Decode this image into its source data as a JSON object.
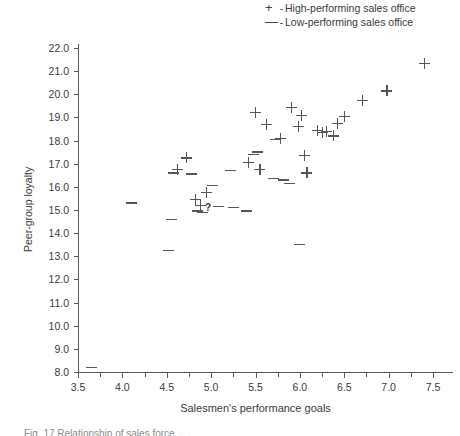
{
  "figure": {
    "caption_partial": "Fig. 17  Relationship of sales force ..."
  },
  "legend": {
    "position": "top-right",
    "items": [
      {
        "marker": "+",
        "marker_name": "plus-marker",
        "separator": "-",
        "label": "High-performing sales office"
      },
      {
        "marker": "—",
        "marker_name": "dash-marker",
        "separator": "-",
        "label": "Low-performing sales office"
      }
    ]
  },
  "chart_data": {
    "type": "scatter",
    "title": "",
    "xlabel": "Salesmen's performance goals",
    "ylabel": "Peer-group loyalty",
    "xlim": [
      3.5,
      7.5
    ],
    "ylim": [
      8.0,
      22.0
    ],
    "grid": false,
    "x_ticks": [
      "3.5",
      "4.0",
      "4.5",
      "5.0",
      "5.5",
      "6.0",
      "6.5",
      "7.0",
      "7.5"
    ],
    "x_tick_values": [
      3.5,
      4.0,
      4.5,
      5.0,
      5.5,
      6.0,
      6.5,
      7.0,
      7.5
    ],
    "x_minor_tick_values": [
      3.75,
      4.25,
      4.75,
      5.25,
      5.75,
      6.25,
      6.75,
      7.25
    ],
    "y_ticks": [
      "8.0",
      "9.0",
      "10.0",
      "11.0",
      "12.0",
      "13.0",
      "14.0",
      "15.0",
      "16.0",
      "17.0",
      "18.0",
      "19.0",
      "20.0",
      "21.0",
      "22.0"
    ],
    "y_tick_values": [
      8.0,
      9.0,
      10.0,
      11.0,
      12.0,
      13.0,
      14.0,
      15.0,
      16.0,
      17.0,
      18.0,
      19.0,
      20.0,
      21.0,
      22.0
    ],
    "series": [
      {
        "name": "High-performing sales office",
        "marker": "+",
        "points": [
          [
            4.62,
            16.75
          ],
          [
            4.72,
            17.25
          ],
          [
            4.82,
            15.45
          ],
          [
            4.88,
            15.2
          ],
          [
            4.95,
            15.75
          ],
          [
            5.42,
            17.05
          ],
          [
            5.5,
            19.2
          ],
          [
            5.55,
            16.75
          ],
          [
            5.62,
            18.7
          ],
          [
            5.78,
            18.1
          ],
          [
            5.9,
            19.45
          ],
          [
            5.98,
            18.6
          ],
          [
            6.02,
            19.1
          ],
          [
            6.05,
            17.35
          ],
          [
            6.08,
            16.6
          ],
          [
            6.2,
            18.45
          ],
          [
            6.25,
            18.35
          ],
          [
            6.3,
            18.4
          ],
          [
            6.38,
            18.2
          ],
          [
            6.42,
            18.75
          ],
          [
            6.5,
            19.05
          ],
          [
            6.7,
            19.75
          ],
          [
            6.98,
            20.15
          ],
          [
            7.4,
            21.35
          ]
        ]
      },
      {
        "name": "Low-performing sales office",
        "marker": "—",
        "points": [
          [
            3.65,
            8.2
          ],
          [
            4.1,
            15.3
          ],
          [
            4.52,
            13.25
          ],
          [
            4.55,
            14.6
          ],
          [
            4.58,
            16.6
          ],
          [
            4.78,
            16.55
          ],
          [
            4.85,
            14.95
          ],
          [
            4.9,
            14.88
          ],
          [
            5.02,
            16.05
          ],
          [
            5.08,
            15.15
          ],
          [
            5.22,
            16.7
          ],
          [
            5.25,
            15.1
          ],
          [
            5.4,
            14.95
          ],
          [
            5.48,
            17.4
          ],
          [
            5.52,
            17.5
          ],
          [
            5.7,
            16.35
          ],
          [
            5.72,
            18.05
          ],
          [
            5.82,
            16.3
          ],
          [
            5.88,
            16.15
          ],
          [
            6.0,
            13.5
          ]
        ]
      }
    ],
    "annotations": [
      {
        "text": "?",
        "x": 4.92,
        "y": 15.12,
        "name": "question-mark-annotation"
      }
    ]
  }
}
